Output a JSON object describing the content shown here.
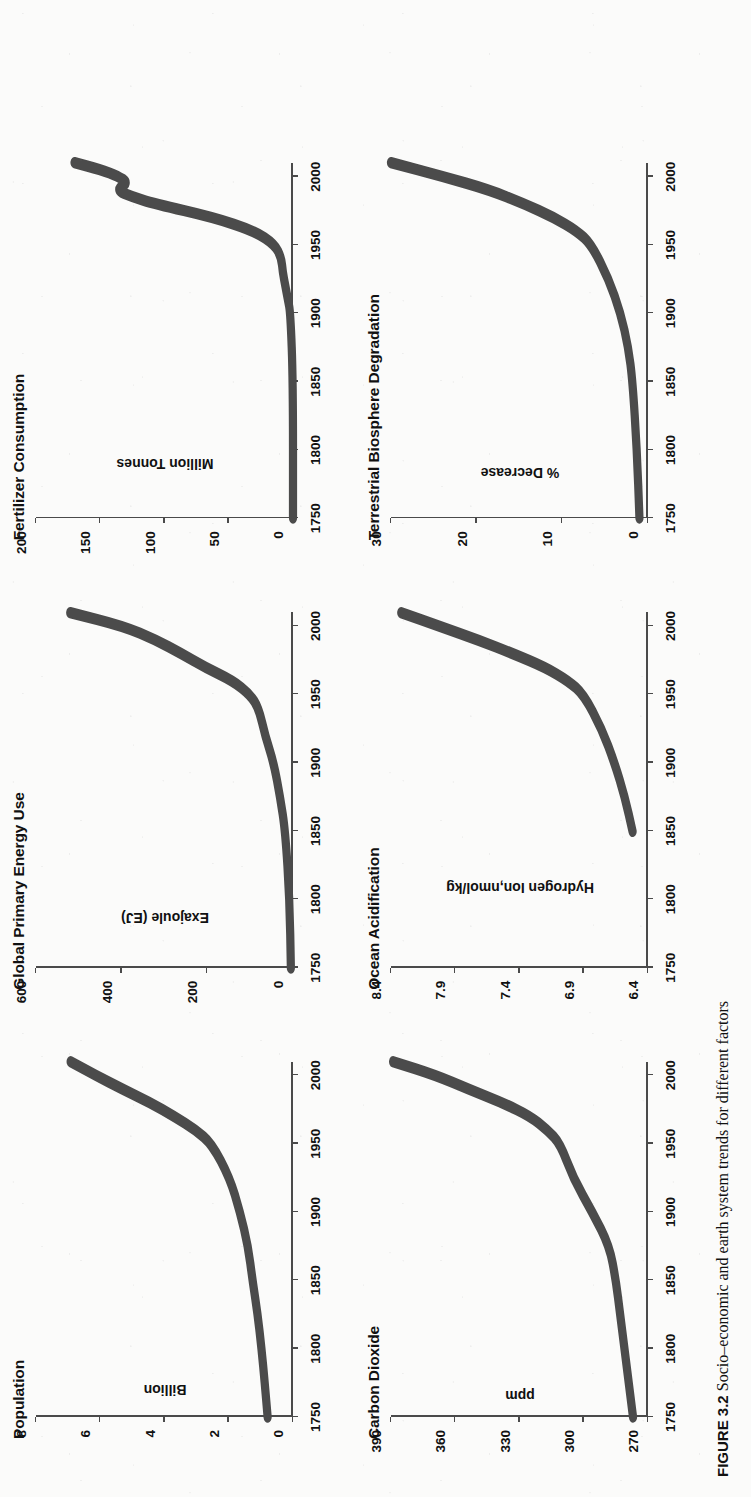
{
  "caption": {
    "figure_number": "FIGURE 3.2",
    "text": "Socio–economic and earth system trends for different factors"
  },
  "page_orientation_deg": -90,
  "chart_data": [
    {
      "type": "line",
      "title": "Population",
      "xlabel": "",
      "ylabel": "Billion",
      "xticks": [
        1750,
        1800,
        1850,
        1900,
        1950,
        2000
      ],
      "yticks": [
        0,
        2,
        4,
        6,
        8
      ],
      "xlim": [
        1750,
        2010
      ],
      "ylim": [
        0,
        8
      ],
      "grid": false,
      "x": [
        1750,
        1775,
        1800,
        1825,
        1850,
        1875,
        1900,
        1925,
        1950,
        1960,
        1970,
        1980,
        1990,
        2000,
        2010
      ],
      "values": [
        0.79,
        0.88,
        0.98,
        1.1,
        1.26,
        1.4,
        1.65,
        1.97,
        2.53,
        3.03,
        3.7,
        4.44,
        5.32,
        6.14,
        6.92
      ]
    },
    {
      "type": "line",
      "title": "Global Primary Energy Use",
      "xlabel": "",
      "ylabel": "Exajoule (EJ)",
      "xticks": [
        1750,
        1800,
        1850,
        1900,
        1950,
        2000
      ],
      "yticks": [
        0,
        200,
        400,
        600
      ],
      "xlim": [
        1750,
        2010
      ],
      "ylim": [
        0,
        600
      ],
      "grid": false,
      "x": [
        1750,
        1800,
        1850,
        1875,
        1900,
        1920,
        1940,
        1950,
        1960,
        1970,
        1980,
        1990,
        2000,
        2010
      ],
      "values": [
        5,
        8,
        18,
        30,
        45,
        65,
        80,
        100,
        140,
        205,
        260,
        320,
        395,
        520
      ]
    },
    {
      "type": "line",
      "title": "Fertilizer Consumption",
      "xlabel": "",
      "ylabel": "Million Tonnes",
      "xticks": [
        1750,
        1800,
        1850,
        1900,
        1950,
        2000
      ],
      "yticks": [
        0,
        50,
        100,
        150,
        200
      ],
      "xlim": [
        1750,
        2010
      ],
      "ylim": [
        0,
        200
      ],
      "grid": false,
      "x": [
        1750,
        1850,
        1900,
        1910,
        1920,
        1930,
        1940,
        1950,
        1960,
        1970,
        1980,
        1985,
        1990,
        1995,
        2000,
        2005,
        2010
      ],
      "values": [
        0,
        0,
        2,
        4,
        6,
        8,
        9,
        14,
        30,
        62,
        108,
        125,
        138,
        128,
        136,
        150,
        170
      ]
    },
    {
      "type": "line",
      "title": "Carbon Dioxide",
      "xlabel": "",
      "ylabel": "ppm",
      "xticks": [
        1750,
        1800,
        1850,
        1900,
        1950,
        2000
      ],
      "yticks": [
        270,
        300,
        330,
        360,
        390
      ],
      "xlim": [
        1750,
        2010
      ],
      "ylim": [
        270,
        390
      ],
      "grid": false,
      "x": [
        1750,
        1800,
        1825,
        1850,
        1875,
        1900,
        1925,
        1950,
        1960,
        1970,
        1980,
        1990,
        2000,
        2010
      ],
      "values": [
        277,
        281,
        283,
        285,
        288,
        296,
        305,
        311,
        317,
        325,
        338,
        354,
        369,
        389
      ]
    },
    {
      "type": "line",
      "title": "Ocean Acidification",
      "xlabel": "",
      "ylabel": "Hydrogen Ion,nmol/kg",
      "xticks": [
        1750,
        1800,
        1850,
        1900,
        1950,
        2000
      ],
      "yticks": [
        6.4,
        6.9,
        7.4,
        7.9,
        8.4
      ],
      "xlim": [
        1750,
        2010
      ],
      "ylim": [
        6.4,
        8.4
      ],
      "grid": false,
      "x": [
        1850,
        1875,
        1900,
        1925,
        1950,
        1960,
        1970,
        1980,
        1990,
        2000,
        2010
      ],
      "values": [
        6.52,
        6.58,
        6.66,
        6.76,
        6.9,
        7.02,
        7.2,
        7.45,
        7.72,
        8.02,
        8.32
      ]
    },
    {
      "type": "line",
      "title": "Terrestrial Biosphere Degradation",
      "xlabel": "",
      "ylabel": "% Decrease",
      "xticks": [
        1750,
        1800,
        1850,
        1900,
        1950,
        2000
      ],
      "yticks": [
        0,
        10,
        20,
        30
      ],
      "xlim": [
        1750,
        2010
      ],
      "ylim": [
        0,
        30
      ],
      "grid": false,
      "x": [
        1750,
        1800,
        1850,
        1875,
        1900,
        1925,
        1950,
        1960,
        1970,
        1980,
        1990,
        2000,
        2010
      ],
      "values": [
        1.0,
        1.3,
        1.8,
        2.3,
        3.2,
        4.6,
        6.6,
        8.3,
        11.0,
        14.5,
        18.5,
        24.0,
        30.0
      ]
    }
  ]
}
